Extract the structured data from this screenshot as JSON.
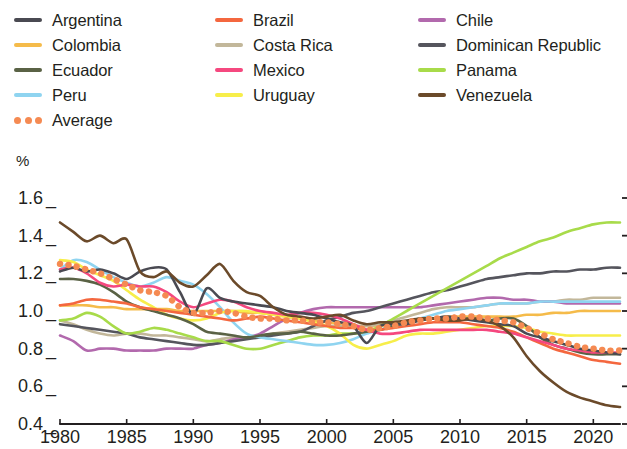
{
  "chart_data": {
    "type": "line",
    "title": "",
    "subtitle": "",
    "xlabel": "",
    "ylabel": "%",
    "xlim": [
      1980,
      2022
    ],
    "ylim": [
      0.4,
      1.6
    ],
    "grid": false,
    "legend_position": "top",
    "ytick_labels": [
      "1.6",
      "1.4",
      "1.2",
      "1.0",
      "0.8",
      "0.6",
      "0.4"
    ],
    "ytick_values": [
      1.6,
      1.4,
      1.2,
      1.0,
      0.8,
      0.6,
      0.4
    ],
    "xtick_labels": [
      "1980",
      "1985",
      "1990",
      "1995",
      "2000",
      "2005",
      "2010",
      "2015",
      "2020"
    ],
    "xtick_values": [
      1980,
      1985,
      1990,
      1995,
      2000,
      2005,
      2010,
      2015,
      2020
    ],
    "x": [
      1980,
      1981,
      1982,
      1983,
      1984,
      1985,
      1986,
      1987,
      1988,
      1989,
      1990,
      1991,
      1992,
      1993,
      1994,
      1995,
      1996,
      1997,
      1998,
      1999,
      2000,
      2001,
      2002,
      2003,
      2004,
      2005,
      2006,
      2007,
      2008,
      2009,
      2010,
      2011,
      2012,
      2013,
      2014,
      2015,
      2016,
      2017,
      2018,
      2019,
      2020,
      2021,
      2022
    ],
    "series": [
      {
        "name": "Argentina",
        "color": "#4a4a52",
        "style": "solid",
        "values": [
          1.21,
          1.23,
          1.21,
          1.22,
          1.2,
          1.17,
          1.21,
          1.23,
          1.22,
          1.1,
          0.98,
          1.12,
          1.07,
          1.05,
          1.04,
          1.03,
          1.02,
          1.0,
          0.99,
          0.98,
          0.96,
          0.94,
          0.92,
          0.83,
          0.92,
          0.93,
          0.93,
          0.95,
          0.96,
          0.97,
          0.96,
          0.95,
          0.94,
          0.93,
          0.92,
          0.88,
          0.86,
          0.84,
          0.82,
          0.8,
          0.79,
          0.78,
          0.77
        ]
      },
      {
        "name": "Brazil",
        "color": "#f4673f",
        "style": "solid",
        "values": [
          1.03,
          1.04,
          1.06,
          1.06,
          1.05,
          1.04,
          1.02,
          1.01,
          1.0,
          0.99,
          0.98,
          0.97,
          0.96,
          0.95,
          0.96,
          0.97,
          0.96,
          0.95,
          0.94,
          0.93,
          0.92,
          0.91,
          0.91,
          0.9,
          0.9,
          0.91,
          0.92,
          0.93,
          0.94,
          0.94,
          0.94,
          0.93,
          0.92,
          0.91,
          0.89,
          0.86,
          0.83,
          0.8,
          0.78,
          0.76,
          0.74,
          0.73,
          0.72
        ]
      },
      {
        "name": "Chile",
        "color": "#b269ad",
        "style": "solid",
        "values": [
          0.87,
          0.84,
          0.79,
          0.8,
          0.8,
          0.79,
          0.79,
          0.79,
          0.8,
          0.8,
          0.8,
          0.82,
          0.83,
          0.85,
          0.86,
          0.88,
          0.92,
          0.96,
          0.99,
          1.01,
          1.02,
          1.02,
          1.02,
          1.02,
          1.02,
          1.02,
          1.02,
          1.02,
          1.03,
          1.04,
          1.05,
          1.06,
          1.07,
          1.07,
          1.06,
          1.06,
          1.05,
          1.05,
          1.04,
          1.04,
          1.04,
          1.04,
          1.04
        ]
      },
      {
        "name": "Colombia",
        "color": "#f5bb4a",
        "style": "solid",
        "values": [
          1.03,
          1.03,
          1.03,
          1.02,
          1.02,
          1.01,
          1.01,
          1.01,
          1.01,
          1.0,
          1.0,
          1.0,
          1.0,
          1.0,
          0.99,
          0.99,
          0.98,
          0.97,
          0.96,
          0.95,
          0.94,
          0.93,
          0.92,
          0.92,
          0.92,
          0.93,
          0.94,
          0.95,
          0.96,
          0.97,
          0.97,
          0.97,
          0.97,
          0.97,
          0.97,
          0.98,
          0.98,
          0.99,
          0.99,
          1.0,
          1.0,
          1.0,
          1.0
        ]
      },
      {
        "name": "Costa Rica",
        "color": "#c2b79a",
        "style": "solid",
        "values": [
          0.95,
          0.93,
          0.9,
          0.88,
          0.87,
          0.88,
          0.88,
          0.87,
          0.87,
          0.86,
          0.85,
          0.84,
          0.85,
          0.86,
          0.86,
          0.87,
          0.88,
          0.89,
          0.9,
          0.91,
          0.92,
          0.92,
          0.92,
          0.92,
          0.93,
          0.95,
          0.97,
          0.99,
          1.01,
          1.02,
          1.02,
          1.02,
          1.03,
          1.04,
          1.04,
          1.04,
          1.05,
          1.05,
          1.06,
          1.06,
          1.07,
          1.07,
          1.07
        ]
      },
      {
        "name": "Dominican Republic",
        "color": "#55555d",
        "style": "solid",
        "values": [
          0.93,
          0.92,
          0.91,
          0.9,
          0.89,
          0.88,
          0.86,
          0.85,
          0.84,
          0.83,
          0.82,
          0.82,
          0.83,
          0.84,
          0.85,
          0.86,
          0.87,
          0.88,
          0.89,
          0.92,
          0.95,
          0.97,
          0.99,
          1.0,
          1.02,
          1.04,
          1.06,
          1.08,
          1.1,
          1.11,
          1.13,
          1.15,
          1.17,
          1.18,
          1.19,
          1.2,
          1.2,
          1.21,
          1.21,
          1.22,
          1.22,
          1.23,
          1.23
        ]
      },
      {
        "name": "Ecuador",
        "color": "#5a6245",
        "style": "solid",
        "values": [
          1.17,
          1.17,
          1.16,
          1.14,
          1.1,
          1.05,
          1.02,
          1.0,
          0.98,
          0.96,
          0.93,
          0.89,
          0.88,
          0.87,
          0.86,
          0.87,
          0.88,
          0.88,
          0.89,
          0.88,
          0.87,
          0.87,
          0.88,
          0.89,
          0.9,
          0.92,
          0.94,
          0.96,
          0.96,
          0.96,
          0.96,
          0.96,
          0.95,
          0.96,
          0.96,
          0.92,
          0.86,
          0.82,
          0.8,
          0.78,
          0.77,
          0.77,
          0.77
        ]
      },
      {
        "name": "Mexico",
        "color": "#f5487f",
        "style": "solid",
        "values": [
          1.22,
          1.23,
          1.2,
          1.15,
          1.13,
          1.14,
          1.13,
          1.13,
          1.1,
          1.05,
          1.02,
          1.04,
          1.06,
          1.05,
          1.02,
          1.0,
          0.99,
          0.98,
          0.99,
          0.99,
          0.98,
          0.96,
          0.93,
          0.9,
          0.88,
          0.88,
          0.89,
          0.9,
          0.9,
          0.9,
          0.9,
          0.9,
          0.9,
          0.89,
          0.88,
          0.86,
          0.84,
          0.82,
          0.8,
          0.79,
          0.78,
          0.78,
          0.78
        ]
      },
      {
        "name": "Panama",
        "color": "#a8db4a",
        "style": "solid",
        "values": [
          0.95,
          0.96,
          0.99,
          0.97,
          0.92,
          0.88,
          0.89,
          0.91,
          0.9,
          0.88,
          0.86,
          0.84,
          0.84,
          0.82,
          0.8,
          0.8,
          0.82,
          0.84,
          0.86,
          0.87,
          0.87,
          0.88,
          0.88,
          0.89,
          0.92,
          0.96,
          1.0,
          1.04,
          1.08,
          1.12,
          1.16,
          1.2,
          1.24,
          1.28,
          1.31,
          1.34,
          1.37,
          1.39,
          1.42,
          1.44,
          1.46,
          1.47,
          1.47
        ]
      },
      {
        "name": "Peru",
        "color": "#8fd4f0",
        "style": "solid",
        "values": [
          1.22,
          1.27,
          1.26,
          1.22,
          1.18,
          1.15,
          1.13,
          1.15,
          1.18,
          1.16,
          1.14,
          1.09,
          1.02,
          0.94,
          0.88,
          0.86,
          0.85,
          0.84,
          0.83,
          0.82,
          0.82,
          0.83,
          0.85,
          0.88,
          0.9,
          0.92,
          0.94,
          0.96,
          0.98,
          1.0,
          1.01,
          1.02,
          1.03,
          1.04,
          1.04,
          1.04,
          1.05,
          1.05,
          1.05,
          1.05,
          1.05,
          1.05,
          1.05
        ]
      },
      {
        "name": "Uruguay",
        "color": "#f7ee4a",
        "style": "solid",
        "values": [
          1.27,
          1.26,
          1.22,
          1.19,
          1.16,
          1.11,
          1.06,
          1.02,
          0.98,
          0.96,
          0.95,
          0.96,
          0.99,
          1.0,
          1.0,
          0.99,
          0.98,
          0.97,
          0.96,
          0.94,
          0.92,
          0.88,
          0.82,
          0.8,
          0.82,
          0.84,
          0.87,
          0.88,
          0.88,
          0.89,
          0.9,
          0.91,
          0.92,
          0.92,
          0.92,
          0.91,
          0.89,
          0.88,
          0.87,
          0.87,
          0.87,
          0.87,
          0.87
        ]
      },
      {
        "name": "Venezuela",
        "color": "#6b4a2a",
        "style": "solid",
        "values": [
          1.47,
          1.42,
          1.37,
          1.4,
          1.36,
          1.38,
          1.21,
          1.18,
          1.21,
          1.15,
          1.13,
          1.19,
          1.25,
          1.16,
          1.1,
          1.08,
          1.02,
          0.98,
          0.97,
          0.96,
          0.97,
          0.98,
          0.95,
          0.93,
          0.94,
          0.94,
          0.95,
          0.96,
          0.96,
          0.95,
          0.95,
          0.96,
          0.95,
          0.92,
          0.86,
          0.76,
          0.68,
          0.62,
          0.57,
          0.54,
          0.52,
          0.5,
          0.49
        ]
      },
      {
        "name": "Average",
        "color": "#f58a52",
        "style": "dotted",
        "values": [
          1.25,
          1.24,
          1.22,
          1.2,
          1.17,
          1.14,
          1.11,
          1.1,
          1.08,
          1.02,
          0.99,
          0.99,
          1.0,
          0.99,
          0.97,
          0.96,
          0.96,
          0.95,
          0.95,
          0.94,
          0.94,
          0.93,
          0.92,
          0.9,
          0.91,
          0.92,
          0.94,
          0.95,
          0.96,
          0.96,
          0.97,
          0.97,
          0.96,
          0.95,
          0.94,
          0.91,
          0.88,
          0.85,
          0.83,
          0.81,
          0.8,
          0.79,
          0.79
        ]
      }
    ]
  },
  "legend": {
    "items": [
      {
        "label": "Argentina",
        "color": "#4a4a52",
        "style": "solid",
        "col": 0,
        "row": 0
      },
      {
        "label": "Brazil",
        "color": "#f4673f",
        "style": "solid",
        "col": 1,
        "row": 0
      },
      {
        "label": "Chile",
        "color": "#b269ad",
        "style": "solid",
        "col": 2,
        "row": 0
      },
      {
        "label": "Colombia",
        "color": "#f5bb4a",
        "style": "solid",
        "col": 0,
        "row": 1
      },
      {
        "label": "Costa Rica",
        "color": "#c2b79a",
        "style": "solid",
        "col": 1,
        "row": 1
      },
      {
        "label": "Dominican Republic",
        "color": "#55555d",
        "style": "solid",
        "col": 2,
        "row": 1
      },
      {
        "label": "Ecuador",
        "color": "#5a6245",
        "style": "solid",
        "col": 0,
        "row": 2
      },
      {
        "label": "Mexico",
        "color": "#f5487f",
        "style": "solid",
        "col": 1,
        "row": 2
      },
      {
        "label": "Panama",
        "color": "#a8db4a",
        "style": "solid",
        "col": 2,
        "row": 2
      },
      {
        "label": "Peru",
        "color": "#8fd4f0",
        "style": "solid",
        "col": 0,
        "row": 3
      },
      {
        "label": "Uruguay",
        "color": "#f7ee4a",
        "style": "solid",
        "col": 1,
        "row": 3
      },
      {
        "label": "Venezuela",
        "color": "#6b4a2a",
        "style": "solid",
        "col": 2,
        "row": 3
      },
      {
        "label": "Average",
        "color": "#f58a52",
        "style": "dotted",
        "col": 0,
        "row": 4
      }
    ]
  },
  "axis": {
    "unit_label": "%",
    "axis_color": "#231f20"
  }
}
